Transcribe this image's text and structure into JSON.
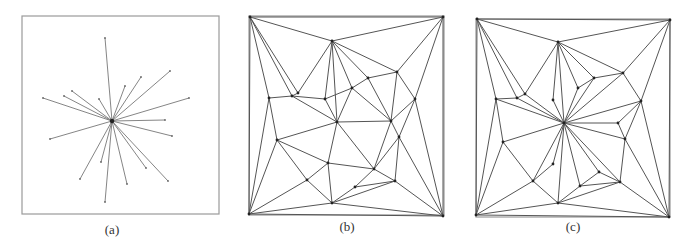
{
  "figure": {
    "panels": [
      {
        "id": "a",
        "caption": "(a)",
        "caption_pos": [
          112,
          222
        ],
        "frame": [
          22,
          16,
          197,
          198
        ],
        "center": [
          112,
          121
        ],
        "star_endpoints": [
          [
            105,
            38
          ],
          [
            170,
            71
          ],
          [
            141,
            77
          ],
          [
            125,
            86
          ],
          [
            189,
            98
          ],
          [
            43,
            98
          ],
          [
            64,
            96
          ],
          [
            72,
            91
          ],
          [
            99,
            99
          ],
          [
            165,
            120
          ],
          [
            172,
            136
          ],
          [
            50,
            139
          ],
          [
            101,
            162
          ],
          [
            146,
            168
          ],
          [
            168,
            181
          ],
          [
            80,
            179
          ],
          [
            127,
            184
          ],
          [
            105,
            202
          ]
        ]
      },
      {
        "id": "b",
        "caption": "(b)",
        "caption_pos": [
          347,
          219
        ],
        "frame": [
          249,
          16,
          195,
          199
        ],
        "vertices": {
          "TL": [
            250,
            17
          ],
          "TR": [
            443,
            17
          ],
          "BL": [
            249,
            214
          ],
          "BR": [
            443,
            216
          ],
          "A": [
            332,
            41
          ],
          "B": [
            397,
            72
          ],
          "C": [
            368,
            78
          ],
          "D": [
            352,
            88
          ],
          "E": [
            415,
            99
          ],
          "F": [
            298,
            93
          ],
          "G": [
            292,
            96
          ],
          "H": [
            269,
            98
          ],
          "I": [
            325,
            99
          ],
          "J": [
            337,
            122
          ],
          "K": [
            391,
            121
          ],
          "L": [
            399,
            137
          ],
          "M": [
            277,
            140
          ],
          "N": [
            328,
            163
          ],
          "O": [
            374,
            169
          ],
          "P": [
            307,
            180
          ],
          "Q": [
            395,
            181
          ],
          "R": [
            355,
            187
          ],
          "S": [
            332,
            203
          ]
        },
        "edges": [
          [
            "TL",
            "TR"
          ],
          [
            "TL",
            "A"
          ],
          [
            "TL",
            "G"
          ],
          [
            "TL",
            "H"
          ],
          [
            "TL",
            "BL"
          ],
          [
            "TL",
            "F"
          ],
          [
            "TR",
            "A"
          ],
          [
            "TR",
            "B"
          ],
          [
            "TR",
            "E"
          ],
          [
            "TR",
            "BR"
          ],
          [
            "A",
            "B"
          ],
          [
            "A",
            "C"
          ],
          [
            "A",
            "D"
          ],
          [
            "A",
            "I"
          ],
          [
            "A",
            "F"
          ],
          [
            "A",
            "J"
          ],
          [
            "B",
            "C"
          ],
          [
            "B",
            "K"
          ],
          [
            "B",
            "E"
          ],
          [
            "C",
            "D"
          ],
          [
            "C",
            "K"
          ],
          [
            "D",
            "I"
          ],
          [
            "D",
            "J"
          ],
          [
            "D",
            "K"
          ],
          [
            "E",
            "K"
          ],
          [
            "E",
            "L"
          ],
          [
            "E",
            "BR"
          ],
          [
            "F",
            "G"
          ],
          [
            "G",
            "H"
          ],
          [
            "G",
            "I"
          ],
          [
            "G",
            "J"
          ],
          [
            "I",
            "J"
          ],
          [
            "H",
            "M"
          ],
          [
            "H",
            "BL"
          ],
          [
            "J",
            "K"
          ],
          [
            "J",
            "M"
          ],
          [
            "J",
            "N"
          ],
          [
            "J",
            "O"
          ],
          [
            "K",
            "L"
          ],
          [
            "K",
            "O"
          ],
          [
            "L",
            "O"
          ],
          [
            "L",
            "Q"
          ],
          [
            "L",
            "BR"
          ],
          [
            "M",
            "N"
          ],
          [
            "M",
            "P"
          ],
          [
            "M",
            "BL"
          ],
          [
            "N",
            "O"
          ],
          [
            "N",
            "P"
          ],
          [
            "N",
            "S"
          ],
          [
            "O",
            "R"
          ],
          [
            "O",
            "Q"
          ],
          [
            "R",
            "Q"
          ],
          [
            "R",
            "S"
          ],
          [
            "P",
            "S"
          ],
          [
            "P",
            "BL"
          ],
          [
            "S",
            "Q"
          ],
          [
            "S",
            "BL"
          ],
          [
            "S",
            "BR"
          ],
          [
            "Q",
            "BR"
          ],
          [
            "BL",
            "BR"
          ]
        ]
      },
      {
        "id": "c",
        "caption": "(c)",
        "caption_pos": [
          573,
          219
        ],
        "frame": [
          476,
          19,
          194,
          198
        ],
        "vertices": {
          "TL": [
            477,
            19
          ],
          "TR": [
            670,
            20
          ],
          "BL": [
            476,
            215
          ],
          "BR": [
            669,
            217
          ],
          "A": [
            558,
            42
          ],
          "B": [
            623,
            73
          ],
          "C": [
            594,
            78
          ],
          "D": [
            578,
            88
          ],
          "E": [
            641,
            101
          ],
          "F": [
            525,
            94
          ],
          "G": [
            517,
            98
          ],
          "H": [
            496,
            99
          ],
          "I": [
            553,
            100
          ],
          "X": [
            564,
            123
          ],
          "K": [
            618,
            123
          ],
          "L": [
            625,
            139
          ],
          "M": [
            503,
            142
          ],
          "V": [
            553,
            164
          ],
          "O": [
            599,
            172
          ],
          "P": [
            533,
            181
          ],
          "Q": [
            620,
            182
          ],
          "R": [
            580,
            186
          ],
          "S": [
            558,
            203
          ]
        },
        "edges": [
          [
            "TL",
            "TR"
          ],
          [
            "TL",
            "A"
          ],
          [
            "TL",
            "G"
          ],
          [
            "TL",
            "F"
          ],
          [
            "TL",
            "H"
          ],
          [
            "TL",
            "BL"
          ],
          [
            "TR",
            "A"
          ],
          [
            "TR",
            "B"
          ],
          [
            "TR",
            "E"
          ],
          [
            "TR",
            "BR"
          ],
          [
            "A",
            "B"
          ],
          [
            "A",
            "D"
          ],
          [
            "A",
            "I"
          ],
          [
            "A",
            "F"
          ],
          [
            "A",
            "X"
          ],
          [
            "A",
            "C"
          ],
          [
            "B",
            "C"
          ],
          [
            "B",
            "E"
          ],
          [
            "C",
            "D"
          ],
          [
            "C",
            "X"
          ],
          [
            "D",
            "X"
          ],
          [
            "B",
            "X"
          ],
          [
            "E",
            "X"
          ],
          [
            "E",
            "K"
          ],
          [
            "E",
            "L"
          ],
          [
            "E",
            "BR"
          ],
          [
            "F",
            "G"
          ],
          [
            "G",
            "H"
          ],
          [
            "G",
            "X"
          ],
          [
            "F",
            "X"
          ],
          [
            "I",
            "X"
          ],
          [
            "H",
            "X"
          ],
          [
            "H",
            "M"
          ],
          [
            "H",
            "BL"
          ],
          [
            "X",
            "K"
          ],
          [
            "X",
            "L"
          ],
          [
            "X",
            "M"
          ],
          [
            "X",
            "P"
          ],
          [
            "X",
            "V"
          ],
          [
            "X",
            "S"
          ],
          [
            "X",
            "R"
          ],
          [
            "X",
            "O"
          ],
          [
            "X",
            "Q"
          ],
          [
            "K",
            "L"
          ],
          [
            "L",
            "Q"
          ],
          [
            "L",
            "BR"
          ],
          [
            "M",
            "P"
          ],
          [
            "M",
            "BL"
          ],
          [
            "V",
            "P"
          ],
          [
            "P",
            "S"
          ],
          [
            "P",
            "BL"
          ],
          [
            "O",
            "R"
          ],
          [
            "O",
            "Q"
          ],
          [
            "R",
            "Q"
          ],
          [
            "R",
            "S"
          ],
          [
            "S",
            "Q"
          ],
          [
            "S",
            "BL"
          ],
          [
            "S",
            "BR"
          ],
          [
            "Q",
            "BR"
          ],
          [
            "BL",
            "BR"
          ]
        ]
      }
    ],
    "colors": {
      "edge": "#555555",
      "frame": "#9a9a9a",
      "vertex": "#222222"
    }
  }
}
